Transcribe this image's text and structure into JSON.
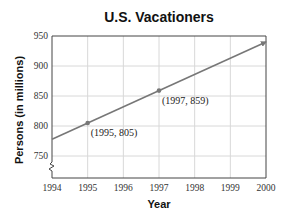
{
  "chart_data": {
    "type": "line",
    "title": "U.S. Vacationers",
    "xlabel": "Year",
    "ylabel": "Persons (in millions)",
    "xlim": [
      1994,
      2000
    ],
    "ylim": [
      730,
      950
    ],
    "x_ticks": [
      1994,
      1995,
      1996,
      1997,
      1998,
      1999,
      2000
    ],
    "y_ticks": [
      750,
      800,
      850,
      900,
      950
    ],
    "grid": true,
    "axis_break": "y",
    "series": [
      {
        "name": "Vacationers",
        "x": [
          1994,
          2000
        ],
        "values": [
          778,
          940
        ],
        "arrow_end": true,
        "color": "#777777"
      }
    ],
    "points": [
      {
        "x": 1995,
        "y": 805,
        "label": "(1995, 805)"
      },
      {
        "x": 1997,
        "y": 859,
        "label": "(1997, 859)"
      }
    ]
  }
}
